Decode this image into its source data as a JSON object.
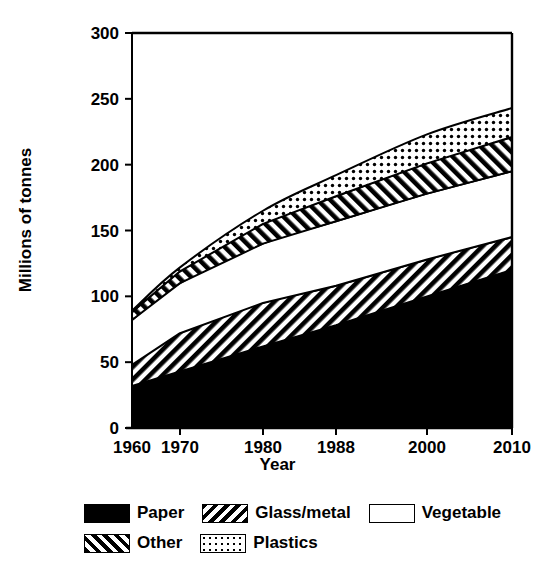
{
  "chart_data": {
    "type": "area",
    "stacked": true,
    "title": "",
    "xlabel": "Year",
    "ylabel": "Millions of tonnes",
    "x": [
      1960,
      1970,
      1980,
      1988,
      2000,
      2010
    ],
    "xtick_labels": [
      "1960",
      "1970",
      "1980",
      "1988",
      "2000",
      "2010"
    ],
    "xtick_positions_px": [
      132,
      180,
      263,
      336,
      427,
      512
    ],
    "ytick_labels": [
      "0",
      "50",
      "100",
      "150",
      "200",
      "250",
      "300"
    ],
    "ytick_values": [
      0,
      50,
      100,
      150,
      200,
      250,
      300
    ],
    "ylim": [
      0,
      300
    ],
    "grid": false,
    "legend_position": "below",
    "series": [
      {
        "name": "Paper",
        "fill": "solid-black",
        "color": "#000000",
        "values": [
          32,
          43,
          62,
          78,
          100,
          120
        ]
      },
      {
        "name": "Other",
        "fill": "forward-slash-hatch",
        "color": "#ffffff",
        "values": [
          16,
          29,
          33,
          30,
          28,
          25
        ]
      },
      {
        "name": "Vegetable",
        "fill": "blank-white",
        "color": "#ffffff",
        "values": [
          34,
          38,
          45,
          49,
          50,
          50
        ]
      },
      {
        "name": "Glass/metal",
        "fill": "backslash-hatch",
        "color": "#ffffff",
        "values": [
          6,
          9,
          15,
          19,
          23,
          26
        ]
      },
      {
        "name": "Plastics",
        "fill": "dotted",
        "color": "#ffffff",
        "values": [
          1,
          3,
          10,
          16,
          22,
          22
        ]
      }
    ],
    "cumulative_tops": {
      "Paper": [
        32,
        43,
        62,
        78,
        100,
        120
      ],
      "Other": [
        48,
        72,
        95,
        108,
        128,
        145
      ],
      "Vegetable": [
        82,
        110,
        140,
        157,
        178,
        195
      ],
      "Glass/metal": [
        88,
        119,
        155,
        176,
        201,
        221
      ],
      "Plastics": [
        89,
        122,
        165,
        192,
        223,
        243
      ]
    }
  },
  "legend": {
    "rows": [
      [
        {
          "label": "Paper",
          "pattern": "solid-black"
        },
        {
          "label": "Glass/metal",
          "pattern": "backslash-hatch"
        },
        {
          "label": "Vegetable",
          "pattern": "blank-white"
        }
      ],
      [
        {
          "label": "Other",
          "pattern": "forward-slash-hatch"
        },
        {
          "label": "Plastics",
          "pattern": "dotted"
        }
      ]
    ]
  }
}
